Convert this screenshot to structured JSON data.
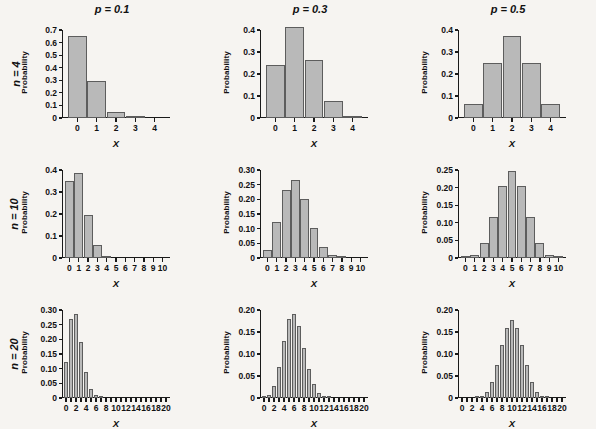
{
  "figure": {
    "background_color": "#f6f4f1",
    "bar_fill_color": "#b9b9b9",
    "bar_stroke_color": "#5d5d5d",
    "axis_color": "#1a1a1a",
    "xlabel": "X",
    "ylabel": "Probability"
  },
  "columns": [
    {
      "id": "p01",
      "title": "p = 0.1",
      "p": 0.1
    },
    {
      "id": "p03",
      "title": "p = 0.3",
      "p": 0.3
    },
    {
      "id": "p05",
      "title": "p = 0.5",
      "p": 0.5
    }
  ],
  "rows": [
    {
      "id": "n4",
      "title": "n = 4",
      "n": 4
    },
    {
      "id": "n10",
      "title": "n = 10",
      "n": 10
    },
    {
      "id": "n20",
      "title": "n = 20",
      "n": 20
    }
  ],
  "chart_data": [
    {
      "id": "n4-p01",
      "type": "bar",
      "title": "p = 0.1",
      "row_label": "n = 4",
      "n": 4,
      "p": 0.1,
      "xlabel": "X",
      "ylabel": "Probability",
      "categories": [
        0,
        1,
        2,
        3,
        4
      ],
      "values": [
        0.6561,
        0.2916,
        0.0486,
        0.0036,
        0.0001
      ],
      "xticks": [
        0,
        1,
        2,
        3,
        4
      ],
      "xticklabels": [
        "0",
        "1",
        "2",
        "3",
        "4"
      ],
      "yticks": [
        0,
        0.1,
        0.2,
        0.3,
        0.4,
        0.5,
        0.6,
        0.7
      ],
      "yticklabels": [
        "0",
        "0.1",
        "0.2",
        "0.3",
        "0.4",
        "0.5",
        "0.6",
        "0.7"
      ],
      "ylim": [
        0,
        0.7
      ],
      "grid": false,
      "legend": false
    },
    {
      "id": "n4-p03",
      "type": "bar",
      "title": "p = 0.3",
      "row_label": "n = 4",
      "n": 4,
      "p": 0.3,
      "xlabel": "X",
      "ylabel": "Probability",
      "categories": [
        0,
        1,
        2,
        3,
        4
      ],
      "values": [
        0.2401,
        0.4116,
        0.2646,
        0.0756,
        0.0081
      ],
      "xticks": [
        0,
        1,
        2,
        3,
        4
      ],
      "xticklabels": [
        "0",
        "1",
        "2",
        "3",
        "4"
      ],
      "yticks": [
        0,
        0.1,
        0.2,
        0.3,
        0.4
      ],
      "yticklabels": [
        "0",
        "0.1",
        "0.2",
        "0.3",
        "0.4"
      ],
      "ylim": [
        0,
        0.4
      ],
      "grid": false,
      "legend": false
    },
    {
      "id": "n4-p05",
      "type": "bar",
      "title": "p = 0.5",
      "row_label": "n = 4",
      "n": 4,
      "p": 0.5,
      "xlabel": "X",
      "ylabel": "Probability",
      "categories": [
        0,
        1,
        2,
        3,
        4
      ],
      "values": [
        0.0625,
        0.25,
        0.375,
        0.25,
        0.0625
      ],
      "xticks": [
        0,
        1,
        2,
        3,
        4
      ],
      "xticklabels": [
        "0",
        "1",
        "2",
        "3",
        "4"
      ],
      "yticks": [
        0,
        0.1,
        0.2,
        0.3,
        0.4
      ],
      "yticklabels": [
        "0",
        "0.1",
        "0.2",
        "0.3",
        "0.4"
      ],
      "ylim": [
        0,
        0.4
      ],
      "grid": false,
      "legend": false
    },
    {
      "id": "n10-p01",
      "type": "bar",
      "title": "p = 0.1",
      "row_label": "n = 10",
      "n": 10,
      "p": 0.1,
      "xlabel": "X",
      "ylabel": "Probability",
      "categories": [
        0,
        1,
        2,
        3,
        4,
        5,
        6,
        7,
        8,
        9,
        10
      ],
      "values": [
        0.3487,
        0.3874,
        0.1937,
        0.0574,
        0.0112,
        0.0015,
        0.0001,
        0.0,
        0.0,
        0.0,
        0.0
      ],
      "xticks": [
        0,
        1,
        2,
        3,
        4,
        5,
        6,
        7,
        8,
        9,
        10
      ],
      "xticklabels": [
        "0",
        "1",
        "2",
        "3",
        "4",
        "5",
        "6",
        "7",
        "8",
        "9",
        "10"
      ],
      "yticks": [
        0,
        0.1,
        0.2,
        0.3,
        0.4
      ],
      "yticklabels": [
        "0",
        "0.1",
        "0.2",
        "0.3",
        "0.4"
      ],
      "ylim": [
        0,
        0.4
      ],
      "grid": false,
      "legend": false
    },
    {
      "id": "n10-p03",
      "type": "bar",
      "title": "p = 0.3",
      "row_label": "n = 10",
      "n": 10,
      "p": 0.3,
      "xlabel": "X",
      "ylabel": "Probability",
      "categories": [
        0,
        1,
        2,
        3,
        4,
        5,
        6,
        7,
        8,
        9,
        10
      ],
      "values": [
        0.0282,
        0.1211,
        0.2335,
        0.2668,
        0.2001,
        0.1029,
        0.0368,
        0.009,
        0.0014,
        0.0001,
        0.0
      ],
      "xticks": [
        0,
        1,
        2,
        3,
        4,
        5,
        6,
        7,
        8,
        9,
        10
      ],
      "xticklabels": [
        "0",
        "1",
        "2",
        "3",
        "4",
        "5",
        "6",
        "7",
        "8",
        "9",
        "10"
      ],
      "yticks": [
        0,
        0.05,
        0.1,
        0.15,
        0.2,
        0.25,
        0.3
      ],
      "yticklabels": [
        "0",
        "0.05",
        "0.10",
        "0.15",
        "0.20",
        "0.25",
        "0.30"
      ],
      "ylim": [
        0,
        0.3
      ],
      "grid": false,
      "legend": false
    },
    {
      "id": "n10-p05",
      "type": "bar",
      "title": "p = 0.5",
      "row_label": "n = 10",
      "n": 10,
      "p": 0.5,
      "xlabel": "X",
      "ylabel": "Probability",
      "categories": [
        0,
        1,
        2,
        3,
        4,
        5,
        6,
        7,
        8,
        9,
        10
      ],
      "values": [
        0.001,
        0.0098,
        0.0439,
        0.1172,
        0.2051,
        0.2461,
        0.2051,
        0.1172,
        0.0439,
        0.0098,
        0.001
      ],
      "xticks": [
        0,
        1,
        2,
        3,
        4,
        5,
        6,
        7,
        8,
        9,
        10
      ],
      "xticklabels": [
        "0",
        "1",
        "2",
        "3",
        "4",
        "5",
        "6",
        "7",
        "8",
        "9",
        "10"
      ],
      "yticks": [
        0,
        0.05,
        0.1,
        0.15,
        0.2,
        0.25
      ],
      "yticklabels": [
        "0",
        "0.05",
        "0.10",
        "0.15",
        "0.20",
        "0.25"
      ],
      "ylim": [
        0,
        0.25
      ],
      "grid": false,
      "legend": false
    },
    {
      "id": "n20-p01",
      "type": "bar",
      "title": "p = 0.1",
      "row_label": "n = 20",
      "n": 20,
      "p": 0.1,
      "xlabel": "X",
      "ylabel": "Probability",
      "categories": [
        0,
        1,
        2,
        3,
        4,
        5,
        6,
        7,
        8,
        9,
        10,
        11,
        12,
        13,
        14,
        15,
        16,
        17,
        18,
        19,
        20
      ],
      "values": [
        0.1216,
        0.2702,
        0.2852,
        0.1901,
        0.0898,
        0.0319,
        0.0089,
        0.002,
        0.0004,
        0.0001,
        0,
        0,
        0,
        0,
        0,
        0,
        0,
        0,
        0,
        0,
        0
      ],
      "xticks": [
        0,
        1,
        2,
        3,
        4,
        5,
        6,
        7,
        8,
        9,
        10,
        11,
        12,
        13,
        14,
        15,
        16,
        17,
        18,
        19,
        20
      ],
      "xticklabels_shown": [
        "0",
        "2",
        "4",
        "6",
        "8",
        "10",
        "12",
        "14",
        "16",
        "18",
        "20"
      ],
      "xticklabel_step": 2,
      "yticks": [
        0,
        0.05,
        0.1,
        0.15,
        0.2,
        0.25,
        0.3
      ],
      "yticklabels": [
        "0",
        "0.05",
        "0.10",
        "0.15",
        "0.20",
        "0.25",
        "0.30"
      ],
      "ylim": [
        0,
        0.3
      ],
      "grid": false,
      "legend": false
    },
    {
      "id": "n20-p03",
      "type": "bar",
      "title": "p = 0.3",
      "row_label": "n = 20",
      "n": 20,
      "p": 0.3,
      "xlabel": "X",
      "ylabel": "Probability",
      "categories": [
        0,
        1,
        2,
        3,
        4,
        5,
        6,
        7,
        8,
        9,
        10,
        11,
        12,
        13,
        14,
        15,
        16,
        17,
        18,
        19,
        20
      ],
      "values": [
        0.0008,
        0.0068,
        0.0278,
        0.0716,
        0.1304,
        0.1789,
        0.1916,
        0.1643,
        0.1144,
        0.0654,
        0.0308,
        0.012,
        0.0039,
        0.001,
        0.0002,
        0,
        0,
        0,
        0,
        0,
        0
      ],
      "xticks": [
        0,
        1,
        2,
        3,
        4,
        5,
        6,
        7,
        8,
        9,
        10,
        11,
        12,
        13,
        14,
        15,
        16,
        17,
        18,
        19,
        20
      ],
      "xticklabels_shown": [
        "0",
        "2",
        "4",
        "6",
        "8",
        "10",
        "12",
        "14",
        "16",
        "18",
        "20"
      ],
      "xticklabel_step": 2,
      "yticks": [
        0,
        0.05,
        0.1,
        0.15,
        0.2
      ],
      "yticklabels": [
        "0",
        "0.05",
        "0.10",
        "0.15",
        "0.20"
      ],
      "ylim": [
        0,
        0.2
      ],
      "grid": false,
      "legend": false
    },
    {
      "id": "n20-p05",
      "type": "bar",
      "title": "p = 0.5",
      "row_label": "n = 20",
      "n": 20,
      "p": 0.5,
      "xlabel": "X",
      "ylabel": "Probability",
      "categories": [
        0,
        1,
        2,
        3,
        4,
        5,
        6,
        7,
        8,
        9,
        10,
        11,
        12,
        13,
        14,
        15,
        16,
        17,
        18,
        19,
        20
      ],
      "values": [
        0,
        0,
        0.0002,
        0.0011,
        0.0046,
        0.0148,
        0.037,
        0.0739,
        0.1201,
        0.1602,
        0.1762,
        0.1602,
        0.1201,
        0.0739,
        0.037,
        0.0148,
        0.0046,
        0.0011,
        0.0002,
        0,
        0
      ],
      "xticks": [
        0,
        1,
        2,
        3,
        4,
        5,
        6,
        7,
        8,
        9,
        10,
        11,
        12,
        13,
        14,
        15,
        16,
        17,
        18,
        19,
        20
      ],
      "xticklabels_shown": [
        "0",
        "2",
        "4",
        "6",
        "8",
        "10",
        "12",
        "14",
        "16",
        "18",
        "20"
      ],
      "xticklabel_step": 2,
      "yticks": [
        0,
        0.05,
        0.1,
        0.15,
        0.2
      ],
      "yticklabels": [
        "0",
        "0.05",
        "0.10",
        "0.15",
        "0.20"
      ],
      "ylim": [
        0,
        0.2
      ],
      "grid": false,
      "legend": false
    }
  ]
}
